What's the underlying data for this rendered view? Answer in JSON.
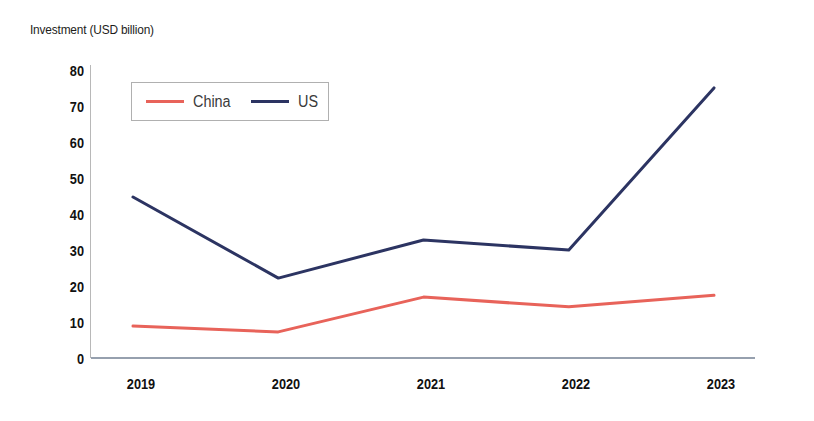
{
  "chart_data": {
    "type": "line",
    "title": "Investment (USD billion)",
    "xlabel": "",
    "ylabel": "Investment (USD billion)",
    "categories": [
      "2019",
      "2020",
      "2021",
      "2022",
      "2023"
    ],
    "series": [
      {
        "name": "China",
        "color": "#e8635a",
        "values": [
          8.6,
          7.0,
          16.7,
          14.0,
          17.2
        ]
      },
      {
        "name": "US",
        "color": "#2c3462",
        "values": [
          44.6,
          22.0,
          32.6,
          29.8,
          75.0
        ]
      }
    ],
    "ylim": [
      0,
      80
    ],
    "yticks": [
      "0",
      "10",
      "20",
      "30",
      "40",
      "50",
      "60",
      "70",
      "80"
    ],
    "grid": false,
    "legend_position": "top-left"
  },
  "axis": {
    "title": "Investment (USD billion)",
    "y_ticks": [
      "80",
      "70",
      "60",
      "50",
      "40",
      "30",
      "20",
      "10",
      "0"
    ],
    "x_ticks": [
      "2019",
      "2020",
      "2021",
      "2022",
      "2023"
    ]
  },
  "legend": {
    "entries": [
      {
        "label": "China",
        "color": "#e8635a"
      },
      {
        "label": "US",
        "color": "#2c3462"
      }
    ]
  },
  "colors": {
    "china": "#e8635a",
    "us": "#2c3462",
    "axis": "#b8b8b8",
    "baseline": "#96a0ae",
    "text": "#111111"
  }
}
